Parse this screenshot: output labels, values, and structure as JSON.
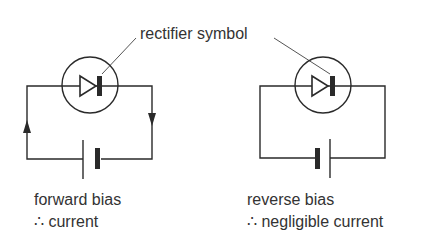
{
  "diagram": {
    "shared_label": "rectifier symbol",
    "colors": {
      "line": "#2a2a2a",
      "text": "#333333",
      "background": "#ffffff"
    },
    "circuits": [
      {
        "id": "forward",
        "caption_line1": "forward bias",
        "caption_line2": "∴ current",
        "current_arrows": true,
        "battery_orientation": "thin-plate-left"
      },
      {
        "id": "reverse",
        "caption_line1": "reverse bias",
        "caption_line2": "∴ negligible current",
        "current_arrows": false,
        "battery_orientation": "thick-plate-left"
      }
    ]
  }
}
